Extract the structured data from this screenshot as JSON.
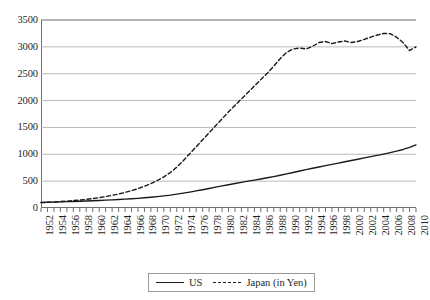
{
  "chart_data": {
    "type": "line",
    "title": "",
    "xlabel": "",
    "ylabel": "",
    "ylim": [
      0,
      3500
    ],
    "xlim": [
      1952,
      2010
    ],
    "y_ticks": [
      0,
      500,
      1000,
      1500,
      2000,
      2500,
      3000,
      3500
    ],
    "grid": "horizontal",
    "legend_position": "bottom-center",
    "x_tick_labels": [
      "1952",
      "1954",
      "1956",
      "1958",
      "1960",
      "1962",
      "1964",
      "1966",
      "1968",
      "1970",
      "1972",
      "1974",
      "1976",
      "1978",
      "1980",
      "1982",
      "1984",
      "1986",
      "1988",
      "1990",
      "1992",
      "1994",
      "1996",
      "1998",
      "2000",
      "2002",
      "2004",
      "2006",
      "2008",
      "2010"
    ],
    "x": [
      1952,
      1953,
      1954,
      1955,
      1956,
      1957,
      1958,
      1959,
      1960,
      1961,
      1962,
      1963,
      1964,
      1965,
      1966,
      1967,
      1968,
      1969,
      1970,
      1971,
      1972,
      1973,
      1974,
      1975,
      1976,
      1977,
      1978,
      1979,
      1980,
      1981,
      1982,
      1983,
      1984,
      1985,
      1986,
      1987,
      1988,
      1989,
      1990,
      1991,
      1992,
      1993,
      1994,
      1995,
      1996,
      1997,
      1998,
      1999,
      2000,
      2001,
      2002,
      2003,
      2004,
      2005,
      2006,
      2007,
      2008,
      2009,
      2010
    ],
    "series": [
      {
        "name": "US",
        "style": "solid",
        "color": "#1a1a1a",
        "values": [
          105,
          108,
          110,
          114,
          118,
          122,
          126,
          130,
          135,
          140,
          146,
          152,
          158,
          165,
          172,
          180,
          190,
          200,
          212,
          225,
          240,
          258,
          276,
          296,
          318,
          340,
          364,
          388,
          412,
          434,
          456,
          478,
          500,
          520,
          540,
          562,
          585,
          610,
          636,
          662,
          688,
          714,
          740,
          764,
          788,
          812,
          836,
          860,
          884,
          908,
          932,
          956,
          980,
          1004,
          1030,
          1058,
          1090,
          1130,
          1175
        ]
      },
      {
        "name": "Japan (in Yen)",
        "style": "dashed",
        "color": "#1a1a1a",
        "values": [
          100,
          106,
          112,
          120,
          128,
          138,
          148,
          160,
          175,
          192,
          212,
          235,
          260,
          290,
          322,
          360,
          405,
          455,
          512,
          580,
          660,
          760,
          880,
          1010,
          1140,
          1270,
          1400,
          1530,
          1660,
          1790,
          1910,
          2030,
          2150,
          2270,
          2390,
          2510,
          2640,
          2780,
          2900,
          2960,
          2980,
          2960,
          3010,
          3080,
          3100,
          3060,
          3090,
          3110,
          3080,
          3100,
          3140,
          3180,
          3220,
          3250,
          3245,
          3180,
          3080,
          2930,
          3000
        ]
      }
    ]
  },
  "legend": {
    "entries": [
      {
        "label": "US",
        "style": "solid"
      },
      {
        "label": "Japan (in Yen)",
        "style": "dashed"
      }
    ]
  }
}
